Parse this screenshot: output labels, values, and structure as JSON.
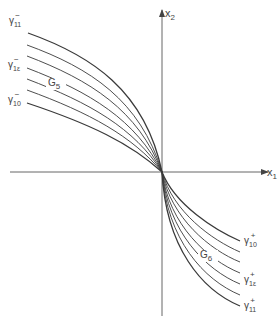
{
  "diagram": {
    "axes": {
      "x1": {
        "label": "x",
        "sub": "1"
      },
      "x2": {
        "label": "x",
        "sub": "2"
      }
    },
    "regions": [
      {
        "label": "G",
        "sub": "5"
      },
      {
        "label": "G",
        "sub": "6"
      }
    ],
    "curve_labels_upper": [
      {
        "symbol": "γ",
        "sub": "11",
        "sup": "−"
      },
      {
        "symbol": "γ",
        "sub": "1ε",
        "sup": "−"
      },
      {
        "symbol": "γ",
        "sub": "10",
        "sup": "−"
      }
    ],
    "curve_labels_lower": [
      {
        "symbol": "γ",
        "sub": "10",
        "sup": "+"
      },
      {
        "symbol": "γ",
        "sub": "1ε",
        "sup": "+"
      },
      {
        "symbol": "γ",
        "sub": "11",
        "sup": "+"
      }
    ],
    "curve_count_per_family": 7,
    "line_color": "#3a3a3a"
  }
}
